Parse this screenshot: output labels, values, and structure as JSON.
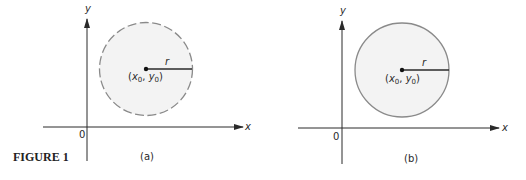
{
  "figure": {
    "caption": "FIGURE 1",
    "panels": [
      {
        "id": "a",
        "label": "(a)",
        "boundary": "dashed",
        "x_axis_label": "x",
        "y_axis_label": "y",
        "origin_label": "0",
        "radius_label": "r",
        "center_label_open": "(",
        "center_x_var": "x",
        "center_sub": "0",
        "center_comma": ", ",
        "center_y_var": "y",
        "center_close": ")"
      },
      {
        "id": "b",
        "label": "(b)",
        "boundary": "solid",
        "x_axis_label": "x",
        "y_axis_label": "y",
        "origin_label": "0",
        "radius_label": "r",
        "center_label_open": "(",
        "center_x_var": "x",
        "center_sub": "0",
        "center_comma": ", ",
        "center_y_var": "y",
        "center_close": ")"
      }
    ],
    "colors": {
      "axis": "#2a2a2a",
      "circle_fill": "#f3f3f3",
      "circle_stroke": "#8a8a8a"
    }
  }
}
